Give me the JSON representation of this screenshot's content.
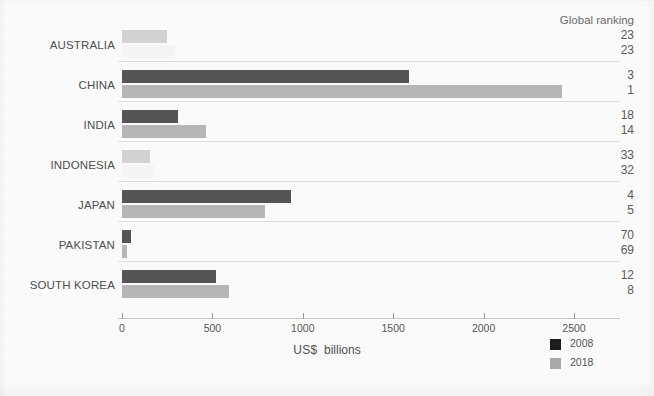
{
  "figure": {
    "ranking_header": "Global ranking",
    "axis_title_currency": "US$",
    "axis_title_unit": "billions"
  },
  "legend": {
    "items": [
      {
        "label": "2008",
        "color": "#1c1c1c",
        "name": "legend-swatch-2008"
      },
      {
        "label": "2018",
        "color": "#a8a8a8",
        "name": "legend-swatch-2018"
      }
    ]
  },
  "chart_data": {
    "type": "bar",
    "orientation": "horizontal",
    "title": "",
    "subtitle": "",
    "xlabel": "US$ billions",
    "ylabel": "",
    "xlim": [
      0,
      2600
    ],
    "xticks": [
      0,
      500,
      1000,
      1500,
      2000,
      2500
    ],
    "xtick_labels": [
      "0",
      "500",
      "1000",
      "1500",
      "2000",
      "2500"
    ],
    "grid": false,
    "legend_position": "bottom-right",
    "categories": [
      "AUSTRALIA",
      "CHINA",
      "INDIA",
      "INDONESIA",
      "JAPAN",
      "PAKISTAN",
      "SOUTH KOREA"
    ],
    "series": [
      {
        "name": "2008",
        "color": "#555555",
        "values": [
          247,
          1588,
          308,
          154,
          934,
          48,
          522
        ]
      },
      {
        "name": "2018",
        "color": "#b6b6b6",
        "values": [
          291,
          2434,
          462,
          175,
          791,
          30,
          594
        ]
      }
    ],
    "annotations": {
      "column_header": "Global ranking",
      "column_series": [
        {
          "name": "2008",
          "values": [
            23,
            3,
            18,
            33,
            4,
            70,
            12
          ]
        },
        {
          "name": "2018",
          "values": [
            23,
            1,
            14,
            32,
            5,
            69,
            8
          ]
        }
      ]
    },
    "rows": [
      {
        "category": "AUSTRALIA",
        "v2008": 247,
        "v2018": 291,
        "rank2008": "23",
        "rank2018": "23",
        "faint": true
      },
      {
        "category": "CHINA",
        "v2008": 1588,
        "v2018": 2434,
        "rank2008": "3",
        "rank2018": "1",
        "faint": false
      },
      {
        "category": "INDIA",
        "v2008": 308,
        "v2018": 462,
        "rank2008": "18",
        "rank2018": "14",
        "faint": false
      },
      {
        "category": "INDONESIA",
        "v2008": 154,
        "v2018": 175,
        "rank2008": "33",
        "rank2018": "32",
        "faint": true
      },
      {
        "category": "JAPAN",
        "v2008": 934,
        "v2018": 791,
        "rank2008": "4",
        "rank2018": "5",
        "faint": false
      },
      {
        "category": "PAKISTAN",
        "v2008": 48,
        "v2018": 30,
        "rank2008": "70",
        "rank2018": "69",
        "faint": false
      },
      {
        "category": "SOUTH KOREA",
        "v2008": 522,
        "v2018": 594,
        "rank2008": "12",
        "rank2018": "8",
        "faint": false
      }
    ]
  }
}
